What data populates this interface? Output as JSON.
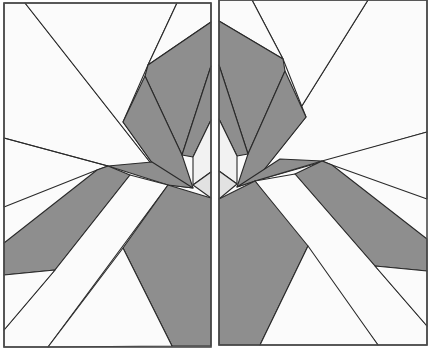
{
  "figure": {
    "colors": {
      "background": "#ffffff",
      "white_piece": "#fbfbfb",
      "light_piece": "#e4e4e4",
      "gray_piece": "#8e8e8e",
      "line": "#2a2a2a",
      "frame": "#4a4a4a"
    },
    "panels": [
      {
        "name": "left-panel",
        "frame": [
          4,
          3,
          207,
          344
        ],
        "pieces": [
          {
            "fill": "white",
            "points": "4,3 25,3 168,185 4,243"
          },
          {
            "fill": "white",
            "points": "25,3 177,3 148,65 123,122 168,185"
          },
          {
            "fill": "white",
            "points": "177,3 211,3 211,22 148,65"
          },
          {
            "fill": "gray",
            "points": "148,65 211,22 211,66 193,157 182,155 145,76"
          },
          {
            "fill": "gray",
            "points": "145,76 182,155 193,188 168,185 123,122"
          },
          {
            "fill": "light",
            "points": "211,66 211,172 193,185 193,157"
          },
          {
            "fill": "light",
            "points": "193,185 211,172 211,198"
          },
          {
            "fill": "gray",
            "points": "108,166 152,163 193,188 168,185"
          },
          {
            "fill": "white",
            "points": "4,243 168,185 108,166 97,174 4,207"
          },
          {
            "fill": "gray",
            "points": "4,243 97,174 130,177 55,270 4,275"
          },
          {
            "fill": "white",
            "points": "130,177 168,185 48,347 4,331 4,328 55,270"
          },
          {
            "fill": "gray",
            "points": "168,185 211,198 211,346 172,346 123,248"
          },
          {
            "fill": "white",
            "points": "123,248 172,346 48,347"
          },
          {
            "fill": "white",
            "points": "4,275 55,270 4,328"
          }
        ]
      },
      {
        "name": "right-panel",
        "frame": [
          219,
          0,
          208,
          345
        ],
        "mirror_of": "left-panel"
      }
    ]
  }
}
